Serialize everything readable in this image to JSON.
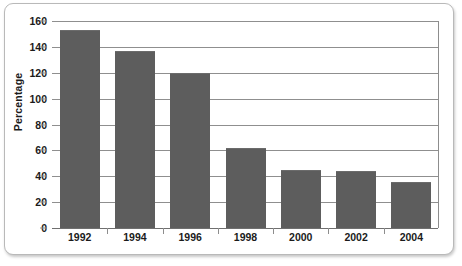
{
  "chart_data": {
    "type": "bar",
    "title": "",
    "subtitle": "",
    "xlabel": "",
    "ylabel": "Percentage",
    "categories": [
      "1992",
      "1994",
      "1996",
      "1998",
      "2000",
      "2002",
      "2004"
    ],
    "values": [
      152,
      136,
      119,
      61,
      44,
      43,
      35
    ],
    "series": [
      {
        "name": "Percentage",
        "values": [
          152,
          136,
          119,
          61,
          44,
          43,
          35
        ]
      }
    ],
    "ylim": [
      0,
      160
    ],
    "ytick_values": [
      0,
      20,
      40,
      60,
      80,
      100,
      120,
      140,
      160
    ],
    "ytick_labels": [
      "0",
      "20",
      "40",
      "60",
      "80",
      "100",
      "120",
      "140",
      "160"
    ],
    "grid": "horizontal",
    "legend": "none",
    "annotations": [],
    "colors": {
      "bar_fill": "#5d5d5d",
      "gridline": "#8f8f8f",
      "axis": "#8d8d8d",
      "text": "#1b1b1b",
      "plot_background": "#ffffff",
      "frame_border": "#b9b9b9"
    }
  }
}
